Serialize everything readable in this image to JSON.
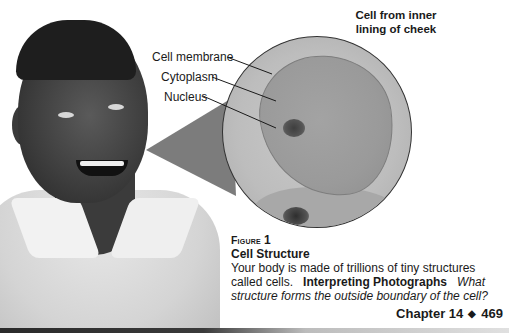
{
  "figure": {
    "photo_title": "Cell from inner lining of cheek",
    "photo_title_line1": "Cell from inner",
    "photo_title_line2": "lining of cheek",
    "labels": [
      {
        "text": "Cell membrane"
      },
      {
        "text": "Cytoplasm"
      },
      {
        "text": "Nucleus"
      }
    ],
    "number_word": "Figure",
    "number": "1",
    "title": "Cell Structure",
    "body": "Your body is made of trillions of tiny structures called cells.",
    "skill": "Interpreting Photographs",
    "question": "What structure forms the outside boundary of the cell?"
  },
  "footer": {
    "chapter": "Chapter 14",
    "separator": "◆",
    "page": "469"
  },
  "colors": {
    "text": "#1a1a1a",
    "background": "#ffffff",
    "micrograph_gray": "#bdbdbd",
    "cone_gray": "#6e6e6e"
  }
}
